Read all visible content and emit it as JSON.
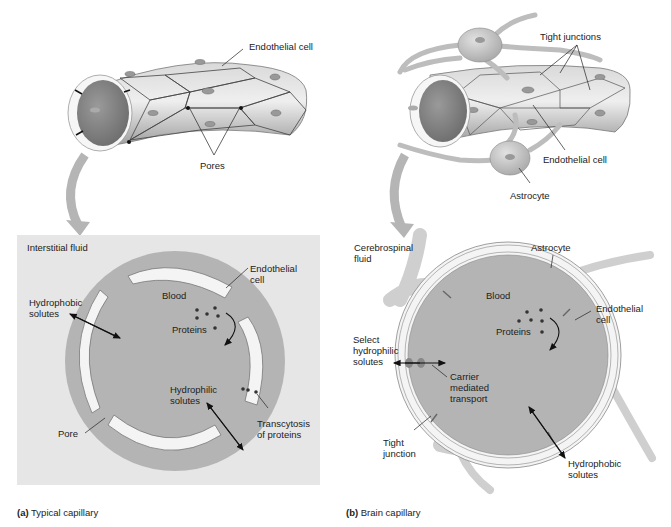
{
  "panel_a": {
    "caption_letter": "(a)",
    "caption_text": "Typical capillary",
    "top_labels": {
      "endothelial_cell": "Endothelial cell",
      "pores": "Pores"
    },
    "cross_section": {
      "region_label": "Interstitial fluid",
      "lumen_label": "Blood",
      "endothelial_cell": "Endothelial\ncell",
      "proteins": "Proteins",
      "hydrophobic": "Hydrophobic\nsolutes",
      "hydrophilic": "Hydrophilic\nsolutes",
      "transcytosis": "Transcytosis\nof proteins",
      "pore": "Pore"
    }
  },
  "panel_b": {
    "caption_letter": "(b)",
    "caption_text": "Brain capillary",
    "top_labels": {
      "tight_junctions": "Tight junctions",
      "endothelial_cell": "Endothelial cell",
      "astrocyte": "Astrocyte"
    },
    "cross_section": {
      "region_label": "Cerebrospinal\nfluid",
      "astrocyte": "Astrocyte",
      "lumen_label": "Blood",
      "endothelial_cell": "Endothelial\ncell",
      "proteins": "Proteins",
      "select_hydrophilic": "Select\nhydrophilic\nsolutes",
      "carrier": "Carrier\nmediated\ntransport",
      "tight_junction": "Tight\njunction",
      "hydrophobic": "Hydrophobic\nsolutes"
    }
  },
  "colors": {
    "interstitial_bg": "#e6e6e6",
    "lumen": "#b4b4b4",
    "cell_wall": "#f4f4f4",
    "tube": "#c8c8c8",
    "arrow_gray": "#b0b0b0",
    "astrocyte": "#cfcfcf"
  }
}
